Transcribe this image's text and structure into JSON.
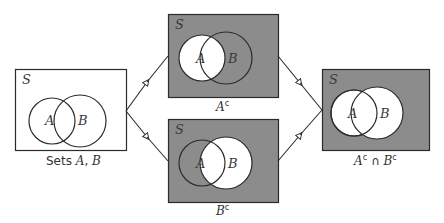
{
  "colors": {
    "shade": "#8c8c8c",
    "outline": "#2b2b2b",
    "white": "#ffffff",
    "text": "#333333"
  },
  "universe_label": "S",
  "set_a_label": "A",
  "set_b_label": "B",
  "panels": [
    {
      "id": "sets",
      "caption_prefix": "Sets ",
      "caption_a": "A",
      "caption_sep": ", ",
      "caption_b": "B"
    },
    {
      "id": "a-complement",
      "caption_main": "A",
      "caption_sup": "c"
    },
    {
      "id": "b-complement",
      "caption_main": "B",
      "caption_sup": "c"
    },
    {
      "id": "intersection",
      "caption_a": "A",
      "caption_sup_a": "c",
      "caption_op": " ∩ ",
      "caption_b": "B",
      "caption_sup_b": "c"
    }
  ]
}
